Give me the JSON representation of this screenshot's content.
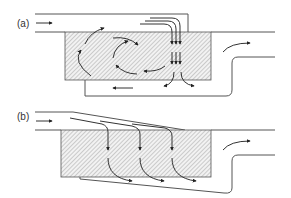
{
  "figure": {
    "panels": [
      {
        "id": "a",
        "label": "(a)",
        "description": "Channel flow entering a hatched chamber with internal recirculation vortices, vertical downward jets at the right side, and a return channel beneath the chamber; outlet on the right rises upward.",
        "elements": [
          "inlet-arrow",
          "recirculation-vortex-left",
          "recirculation-vortex-center",
          "downward-jets",
          "return-flow-arrows",
          "outlet-arrow"
        ]
      },
      {
        "id": "b",
        "label": "(b)",
        "description": "Channel flow entering a hatched chamber from converging inclined streams; three vertical downward flows curve rightward at the bottom into a tapered lower channel; outlet on the right rises upward.",
        "elements": [
          "inlet-arrow",
          "inclined-inflow-lines",
          "downward-flows",
          "bottom-curving-arrows",
          "outlet-arrow"
        ]
      }
    ]
  },
  "colors": {
    "line": "#555555",
    "arrow": "#333333",
    "hatch": "#999999",
    "background": "#ffffff"
  }
}
